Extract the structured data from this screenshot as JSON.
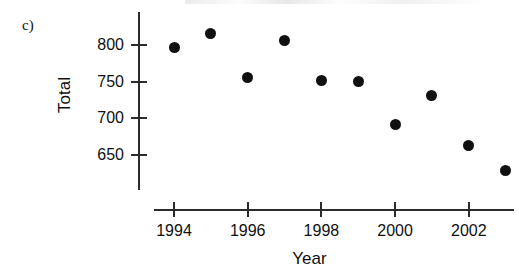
{
  "panel": {
    "label": "c)"
  },
  "chart_data": {
    "type": "scatter",
    "title": "",
    "xlabel": "Year",
    "ylabel": "Total",
    "x": [
      1994,
      1995,
      1996,
      1997,
      1998,
      1999,
      2000,
      2001,
      2002,
      2003
    ],
    "values": [
      797,
      816,
      755,
      806,
      752,
      750,
      692,
      731,
      663,
      629
    ],
    "categories": [
      "1994",
      "1995",
      "1996",
      "1997",
      "1998",
      "1999",
      "2000",
      "2001",
      "2002",
      "2003"
    ],
    "xlim": [
      1993.4,
      2003.6
    ],
    "ylim": [
      610,
      832
    ],
    "xticks": [
      1994,
      1996,
      1998,
      2000,
      2002
    ],
    "xtick_labels": [
      "1994",
      "1996",
      "1998",
      "2000",
      "2002"
    ],
    "yticks": [
      650,
      700,
      750,
      800
    ],
    "ytick_labels": [
      "650",
      "700",
      "750",
      "800"
    ],
    "grid": false,
    "legend": null,
    "marker_color": "#101010",
    "axis_color": "#2b2b2b"
  }
}
